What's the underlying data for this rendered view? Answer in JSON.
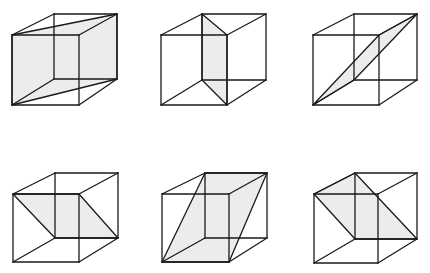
{
  "colors": {
    "line": "#1a1a1a",
    "shade": "#ececec",
    "background": "#ffffff"
  },
  "cubes": [
    {
      "id": "cube-1",
      "v": {
        "FTL": [
          12,
          35
        ],
        "FTR": [
          79,
          35
        ],
        "FBR": [
          79,
          105
        ],
        "FBL": [
          12,
          105
        ],
        "BTL": [
          54,
          14
        ],
        "BTR": [
          117,
          14
        ],
        "BBR": [
          117,
          79
        ],
        "BBL": [
          54,
          79
        ]
      },
      "plane": [
        "FTL",
        "BTR",
        "BBR",
        "FBL"
      ]
    },
    {
      "id": "cube-2",
      "v": {
        "FTL": [
          161,
          35
        ],
        "FTR": [
          227,
          35
        ],
        "FBR": [
          227,
          105
        ],
        "FBL": [
          161,
          105
        ],
        "BTL": [
          202,
          14
        ],
        "BTR": [
          266,
          14
        ],
        "BBR": [
          266,
          80
        ],
        "BBL": [
          202,
          80
        ]
      },
      "plane": [
        "BTL",
        "FTR",
        "FBR",
        "BBL"
      ]
    },
    {
      "id": "cube-3",
      "v": {
        "FTL": [
          313,
          35
        ],
        "FTR": [
          379,
          35
        ],
        "FBR": [
          379,
          105
        ],
        "FBL": [
          313,
          105
        ],
        "BTL": [
          354,
          14
        ],
        "BTR": [
          417,
          14
        ],
        "BBR": [
          417,
          80
        ],
        "BBL": [
          354,
          80
        ]
      },
      "plane": [
        "FBL",
        "FTR",
        "BTR",
        "BBL"
      ]
    },
    {
      "id": "cube-4",
      "v": {
        "FTL": [
          13,
          194
        ],
        "FTR": [
          79,
          194
        ],
        "FBR": [
          79,
          262
        ],
        "FBL": [
          13,
          262
        ],
        "BTL": [
          55,
          173
        ],
        "BTR": [
          118,
          173
        ],
        "BBR": [
          118,
          238
        ],
        "BBL": [
          55,
          238
        ]
      },
      "plane": [
        "FTL",
        "FTR",
        "BBR",
        "BBL"
      ]
    },
    {
      "id": "cube-5",
      "v": {
        "FTL": [
          162,
          194
        ],
        "FTR": [
          229,
          194
        ],
        "FBR": [
          229,
          262
        ],
        "FBL": [
          162,
          262
        ],
        "BTL": [
          205,
          173
        ],
        "BTR": [
          267,
          173
        ],
        "BBR": [
          267,
          238
        ],
        "BBL": [
          205,
          238
        ]
      },
      "plane": [
        "FBL",
        "BTL",
        "BTR",
        "FBR"
      ]
    },
    {
      "id": "cube-6",
      "v": {
        "FTL": [
          314,
          194
        ],
        "FTR": [
          378,
          194
        ],
        "FBR": [
          378,
          263
        ],
        "FBL": [
          314,
          263
        ],
        "BTL": [
          355,
          173
        ],
        "BTR": [
          417,
          173
        ],
        "BBR": [
          417,
          239
        ],
        "BBL": [
          355,
          239
        ]
      },
      "plane": [
        "FTL",
        "BTL",
        "BBR",
        "BBL"
      ]
    }
  ]
}
